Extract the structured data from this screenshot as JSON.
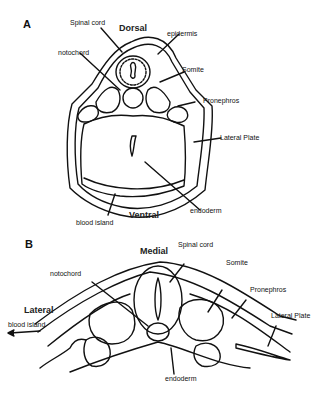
{
  "panel_a": {
    "letter": "A",
    "orientation_top": "Dorsal",
    "orientation_bottom": "Ventral",
    "labels": {
      "spinal_cord": "Spinal cord",
      "epidermis": "epidermis",
      "notochord": "notochord",
      "somite": "Somite",
      "pronephros": "Pronephros",
      "lateral_plate": "Lateral Plate",
      "endoderm": "endoderm",
      "blood_island": "blood island"
    }
  },
  "panel_b": {
    "letter": "B",
    "orientation_top": "Medial",
    "orientation_left": "Lateral",
    "labels": {
      "spinal_cord": "Spinal cord",
      "somite": "Somite",
      "notochord": "notochord",
      "pronephros": "Pronephros",
      "lateral_plate": "Lateral Plate",
      "blood_island": "blood island",
      "endoderm": "endoderm"
    }
  }
}
